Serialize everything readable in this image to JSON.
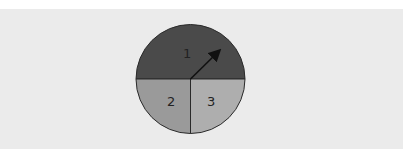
{
  "spinner": {
    "sections": [
      {
        "label": "1",
        "fraction": 0.5,
        "color": "#4a4a4a"
      },
      {
        "label": "2",
        "fraction": 0.25,
        "color": "#9a9a9a"
      },
      {
        "label": "3",
        "fraction": 0.25,
        "color": "#aeaeae"
      }
    ],
    "has_arrow": true
  },
  "colors": {
    "background": "#ebebeb",
    "outline": "#2a2a2a",
    "arrow": "#111111"
  }
}
